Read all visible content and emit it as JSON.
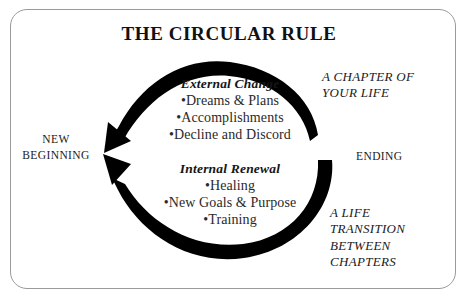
{
  "title": "THE CIRCULAR RULE",
  "cycle": {
    "left_label": {
      "line1": "NEW",
      "line2": "BEGINNING"
    },
    "right_label": "ENDING",
    "groups": [
      {
        "heading": "External Change",
        "items": [
          "•Dreams & Plans",
          "•Accomplishments",
          "•Decline and Discord"
        ]
      },
      {
        "heading": "Internal Renewal",
        "items": [
          "•Healing",
          "•New Goals & Purpose",
          "•Training"
        ]
      }
    ],
    "arrows": [
      {
        "name": "external-change-arc",
        "direction": "ending-to-new-beginning",
        "color": "#000000"
      },
      {
        "name": "internal-renewal-arc",
        "direction": "ending-to-new-beginning",
        "color": "#000000"
      }
    ]
  },
  "annotations": {
    "top_right": {
      "line1": "A CHAPTER OF",
      "line2": "YOUR LIFE"
    },
    "bottom_right": {
      "line1": "A LIFE",
      "line2": "TRANSITION",
      "line3": "BETWEEN",
      "line4": "CHAPTERS"
    }
  },
  "colors": {
    "ink": "#1a1a1a",
    "arc": "#000000",
    "border": "#9a9a9a",
    "background": "#ffffff"
  }
}
